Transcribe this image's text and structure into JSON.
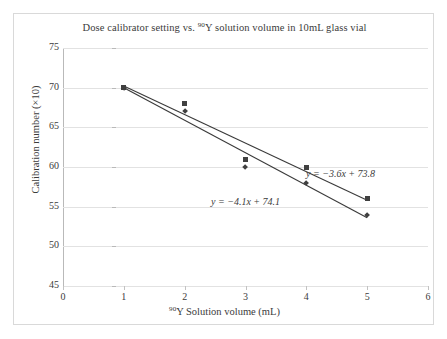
{
  "chart_data": {
    "type": "scatter",
    "title": "Dose calibrator setting vs. 90Y solution volume in 10mL glass vial",
    "title_parts": {
      "before": "Dose calibrator setting vs. ",
      "sup": "90",
      "after": "Y solution volume in 10mL glass vial"
    },
    "xlabel": "90Y Solution volume (mL)",
    "xlabel_parts": {
      "sup": "90",
      "after": "Y Solution volume (mL)"
    },
    "ylabel": "Calibration number (×10)",
    "xlim": [
      0,
      6
    ],
    "ylim": [
      45,
      75
    ],
    "xticks": [
      "0",
      "1",
      "2",
      "3",
      "4",
      "5",
      "6"
    ],
    "yticks": [
      "45",
      "50",
      "55",
      "60",
      "65",
      "70",
      "75"
    ],
    "grid": "horizontal",
    "legend": "none",
    "x": [
      1,
      2,
      3,
      4,
      5
    ],
    "series": [
      {
        "name": "series-square",
        "marker": "square",
        "values": [
          70,
          68,
          61,
          60,
          56
        ]
      },
      {
        "name": "series-diamond",
        "marker": "diamond",
        "values": [
          70,
          67,
          60,
          58,
          54
        ]
      }
    ],
    "trendlines": [
      {
        "name": "trendline-upper",
        "slope": -3.6,
        "intercept": 73.8,
        "x_start": 1,
        "x_end": 5,
        "label": "y = −3.6x + 73.8"
      },
      {
        "name": "trendline-lower",
        "slope": -4.1,
        "intercept": 74.1,
        "x_start": 1,
        "x_end": 5,
        "label": "y = −4.1x + 74.1"
      }
    ],
    "annotations": [
      {
        "name": "equation-upper",
        "text": "y = −3.6x + 73.8"
      },
      {
        "name": "equation-lower",
        "text": "y = −4.1x + 74.1"
      }
    ],
    "colors": {
      "marker": "#404040",
      "trendline": "#3a3a3a",
      "gridline": "#e2e2e2",
      "axis": "#b9b9b9",
      "text": "#3b3b3b",
      "border": "#d9d9d9",
      "background": "#ffffff"
    }
  }
}
